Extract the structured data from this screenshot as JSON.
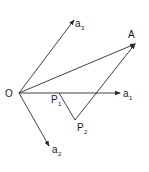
{
  "diagram": {
    "type": "vector-diagram",
    "points": {
      "O": {
        "label": "O",
        "x": 19,
        "y": 93
      },
      "A": {
        "label": "A",
        "x": 135,
        "y": 44
      },
      "P1": {
        "label": "P",
        "sub": "1",
        "x": 59,
        "y": 93
      },
      "P2": {
        "label": "P",
        "sub": "2",
        "x": 75,
        "y": 120
      }
    },
    "axes": {
      "a1": {
        "label": "a",
        "sub": "1",
        "tip_x": 120,
        "tip_y": 93
      },
      "a2": {
        "label": "a",
        "sub": "2",
        "tip_x": 49,
        "tip_y": 146
      },
      "a3": {
        "label": "a",
        "sub": "3",
        "tip_x": 74,
        "tip_y": 20
      }
    },
    "segments": [
      {
        "from": "O",
        "to": "A",
        "arrow": true
      },
      {
        "from": "P1",
        "to": "P2",
        "arrow": false
      },
      {
        "from": "P2",
        "to": "A",
        "arrow": false
      }
    ],
    "stroke_color": "#2a2a2a"
  }
}
